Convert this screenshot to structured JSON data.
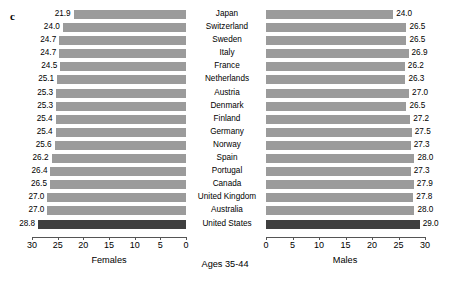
{
  "panel_letter": "c",
  "chart_data": {
    "type": "bar",
    "title": "Ages 35-44",
    "orientation": "horizontal-diverging",
    "categories": [
      "Japan",
      "Switzerland",
      "Sweden",
      "Italy",
      "France",
      "Netherlands",
      "Austria",
      "Denmark",
      "Finland",
      "Germany",
      "Norway",
      "Spain",
      "Portugal",
      "Canada",
      "United Kingdom",
      "Australia",
      "United States"
    ],
    "series": [
      {
        "name": "Females",
        "side": "left",
        "axis_reversed": true,
        "values": [
          21.9,
          24.0,
          24.7,
          24.7,
          24.5,
          25.1,
          25.3,
          25.3,
          25.4,
          25.4,
          25.6,
          26.2,
          26.4,
          26.5,
          27.0,
          27.0,
          28.8
        ]
      },
      {
        "name": "Males",
        "side": "right",
        "axis_reversed": false,
        "values": [
          24.0,
          26.5,
          26.5,
          26.9,
          26.2,
          26.3,
          27.0,
          26.5,
          27.2,
          27.5,
          27.3,
          28.0,
          27.3,
          27.9,
          27.8,
          28.0,
          29.0
        ]
      }
    ],
    "highlight_category": "United States",
    "left_axis_label": "Females",
    "right_axis_label": "Males",
    "left_ticks": [
      30,
      25,
      20,
      15,
      10,
      5,
      0
    ],
    "right_ticks": [
      0,
      5,
      10,
      15,
      20,
      25,
      30
    ],
    "xlim_left": [
      30,
      0
    ],
    "xlim_right": [
      0,
      30
    ],
    "grid": false,
    "legend": "none",
    "bar_color": "#9b9b9b",
    "highlight_color": "#3f3f3f"
  }
}
